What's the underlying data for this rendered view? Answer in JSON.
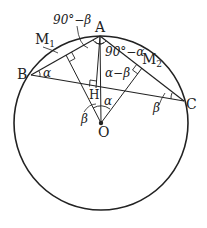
{
  "diagram": {
    "title": "",
    "points": {
      "A": {
        "label": "A",
        "x": 100,
        "y": 36
      },
      "B": {
        "label": "B",
        "x": 31,
        "y": 75
      },
      "C": {
        "label": "C",
        "x": 184,
        "y": 101
      },
      "O": {
        "label": "O",
        "x": 101,
        "y": 123
      },
      "H": {
        "label": "H",
        "x": 97,
        "y": 86
      },
      "M1": {
        "label": "M",
        "sub": "1",
        "x": 66,
        "y": 55
      },
      "M2": {
        "label": "M",
        "sub": "2",
        "x": 142,
        "y": 68
      }
    },
    "circle": {
      "cx": 101,
      "cy": 123,
      "r": 87
    },
    "angle_labels": {
      "top_left": "90°−β",
      "top_right": "90°−α",
      "alpha_minus_beta": "α−β",
      "at_B": "α",
      "at_C": "β",
      "at_O_left": "β",
      "at_O_right": "α"
    },
    "colors": {
      "stroke": "#222222",
      "background": "#ffffff"
    }
  }
}
